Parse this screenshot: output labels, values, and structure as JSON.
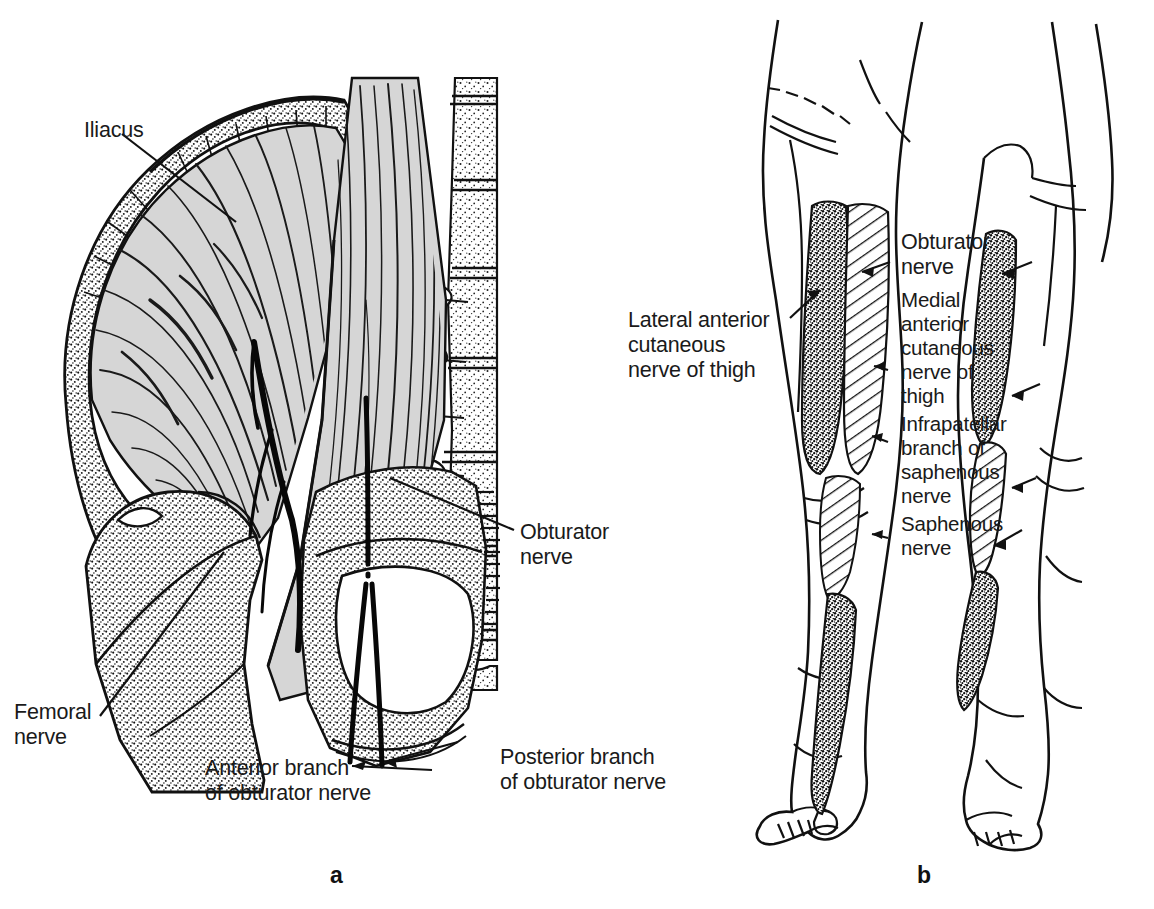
{
  "figure": {
    "panels": [
      {
        "id": "a",
        "letter": "a",
        "caption": "Dissection of iliac fossa showing iliacus, femoral nerve and obturator nerve branches",
        "labels": [
          {
            "name": "iliacus",
            "text": "Iliacus"
          },
          {
            "name": "femoral-nerve",
            "text": "Femoral\nnerve"
          },
          {
            "name": "obturator-nerve",
            "text": "Obturator\nnerve"
          },
          {
            "name": "anterior-branch",
            "text": "Anterior branch\nof obturator nerve"
          },
          {
            "name": "posterior-branch",
            "text": "Posterior branch\nof obturator nerve"
          }
        ]
      },
      {
        "id": "b",
        "letter": "b",
        "caption": "Anterior view of both lower limbs showing cutaneous nerve territories",
        "labels": [
          {
            "name": "lateral-anterior-cutaneous",
            "text": "Lateral anterior\ncutaneous\nnerve of thigh"
          },
          {
            "name": "obturator-nerve",
            "text": "Obturator\nnerve"
          },
          {
            "name": "medial-anterior-cutaneous",
            "text": "Medial\nanterior\ncutaneous\nnerve of\nthigh"
          },
          {
            "name": "infrapatellar-branch",
            "text": "Infrapatellar\nbranch of\nsaphenous\nnerve"
          },
          {
            "name": "saphenous-nerve",
            "text": "Saphenous\nnerve"
          }
        ]
      }
    ]
  },
  "labels_flat": {
    "iliacus": "Iliacus",
    "femoral_nerve": "Femoral\nnerve",
    "obturator_nerve_a": "Obturator\nnerve",
    "anterior_branch": "Anterior branch\nof obturator nerve",
    "posterior_branch": "Posterior branch\nof obturator nerve",
    "lateral_anterior_cutaneous": "Lateral anterior\ncutaneous\nnerve of thigh",
    "obturator_nerve_b": "Obturator\nnerve",
    "medial_anterior_cutaneous": "Medial\nanterior\ncutaneous\nnerve of\nthigh",
    "infrapatellar_branch": "Infrapatellar\nbranch of\nsaphenous\nnerve",
    "saphenous_nerve": "Saphenous\nnerve",
    "panel_a": "a",
    "panel_b": "b"
  },
  "colors": {
    "background": "#ffffff",
    "ink": "#111111",
    "muscle_fill": "#d6d6d6",
    "muscle_fill_dark": "#bdbdbd",
    "bone_stipple": "#1a1a1a",
    "text": "#1a1a1a"
  }
}
